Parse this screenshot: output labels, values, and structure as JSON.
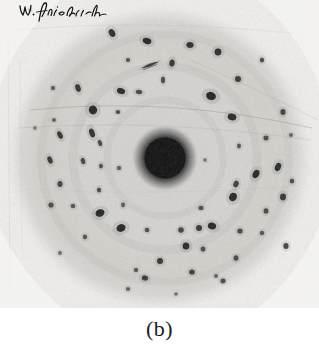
{
  "figure": {
    "caption": "(b)",
    "kind": "laue-x-ray-diffraction-photograph",
    "annotation_signature": "W. Friedrich",
    "pencil_mark_label": "pencil-stroke"
  },
  "colors": {
    "page_background": "#ffffff",
    "film_background": "#f0efed",
    "film_disc": "#d8d7d3",
    "film_disc_edge": "#c9c8c4",
    "spot_dark": "#151515",
    "spot_mid": "#3a3a3a",
    "center_beam": "#080808",
    "center_halo": "#8a8a88",
    "signature_ink": "#151515",
    "caption_text": "#1b1b1b",
    "grain": "#b9b8b4"
  },
  "plate": {
    "width": 319,
    "height": 308,
    "disc_center_x": 160,
    "disc_center_y": 158,
    "disc_radius": 146
  },
  "chart_data": {
    "type": "scatter",
    "title": "",
    "subtitle": "",
    "xlabel": "",
    "ylabel": "",
    "xlim": [
      0,
      319
    ],
    "ylim": [
      0,
      308
    ],
    "grid": false,
    "legend": "none",
    "center_beam": {
      "x": 165,
      "y": 158,
      "r": 21,
      "halo_r": 34
    },
    "spots": [
      {
        "x": 112,
        "y": 33,
        "rx": 3.0,
        "ry": 4.2,
        "a": -25,
        "d": 0.92
      },
      {
        "x": 147,
        "y": 41,
        "rx": 4.4,
        "ry": 3.0,
        "a": 15,
        "d": 0.96
      },
      {
        "x": 190,
        "y": 45,
        "rx": 3.6,
        "ry": 3.0,
        "a": 0,
        "d": 0.9
      },
      {
        "x": 128,
        "y": 60,
        "rx": 2.2,
        "ry": 2.0,
        "a": 0,
        "d": 0.7
      },
      {
        "x": 150,
        "y": 65,
        "rx": 6.5,
        "ry": 1.3,
        "a": -22,
        "d": 0.78
      },
      {
        "x": 172,
        "y": 63,
        "rx": 2.6,
        "ry": 3.6,
        "a": 10,
        "d": 0.88
      },
      {
        "x": 218,
        "y": 52,
        "rx": 3.4,
        "ry": 3.4,
        "a": 0,
        "d": 0.92
      },
      {
        "x": 262,
        "y": 60,
        "rx": 2.2,
        "ry": 2.6,
        "a": 0,
        "d": 0.72
      },
      {
        "x": 163,
        "y": 80,
        "rx": 2.0,
        "ry": 3.2,
        "a": 0,
        "d": 0.8
      },
      {
        "x": 238,
        "y": 79,
        "rx": 3.0,
        "ry": 3.0,
        "a": 0,
        "d": 0.85
      },
      {
        "x": 78,
        "y": 88,
        "rx": 2.6,
        "ry": 4.0,
        "a": -18,
        "d": 0.88
      },
      {
        "x": 53,
        "y": 88,
        "rx": 2.2,
        "ry": 2.2,
        "a": 0,
        "d": 0.62
      },
      {
        "x": 121,
        "y": 91,
        "rx": 4.2,
        "ry": 3.0,
        "a": 18,
        "d": 0.95
      },
      {
        "x": 139,
        "y": 92,
        "rx": 3.4,
        "ry": 2.2,
        "a": 10,
        "d": 0.72
      },
      {
        "x": 211,
        "y": 96,
        "rx": 5.0,
        "ry": 4.0,
        "a": 20,
        "d": 0.97
      },
      {
        "x": 93,
        "y": 110,
        "rx": 4.2,
        "ry": 4.4,
        "a": -15,
        "d": 0.95
      },
      {
        "x": 118,
        "y": 112,
        "rx": 2.4,
        "ry": 2.0,
        "a": 0,
        "d": 0.7
      },
      {
        "x": 283,
        "y": 112,
        "rx": 2.6,
        "ry": 3.0,
        "a": 0,
        "d": 0.8
      },
      {
        "x": 232,
        "y": 117,
        "rx": 4.4,
        "ry": 3.4,
        "a": 15,
        "d": 0.95
      },
      {
        "x": 54,
        "y": 120,
        "rx": 2.0,
        "ry": 2.0,
        "a": 0,
        "d": 0.6
      },
      {
        "x": 92,
        "y": 133,
        "rx": 2.6,
        "ry": 4.6,
        "a": -20,
        "d": 0.9
      },
      {
        "x": 60,
        "y": 135,
        "rx": 2.4,
        "ry": 4.0,
        "a": -25,
        "d": 0.88
      },
      {
        "x": 100,
        "y": 143,
        "rx": 2.0,
        "ry": 3.2,
        "a": -18,
        "d": 0.76
      },
      {
        "x": 266,
        "y": 138,
        "rx": 2.6,
        "ry": 2.4,
        "a": 0,
        "d": 0.72
      },
      {
        "x": 291,
        "y": 135,
        "rx": 2.0,
        "ry": 2.0,
        "a": 0,
        "d": 0.6
      },
      {
        "x": 239,
        "y": 146,
        "rx": 2.0,
        "ry": 2.4,
        "a": 0,
        "d": 0.68
      },
      {
        "x": 50,
        "y": 160,
        "rx": 2.4,
        "ry": 3.8,
        "a": -20,
        "d": 0.86
      },
      {
        "x": 83,
        "y": 161,
        "rx": 2.2,
        "ry": 3.2,
        "a": -15,
        "d": 0.78
      },
      {
        "x": 101,
        "y": 166,
        "rx": 2.0,
        "ry": 2.6,
        "a": 0,
        "d": 0.7
      },
      {
        "x": 119,
        "y": 168,
        "rx": 2.2,
        "ry": 2.2,
        "a": 0,
        "d": 0.62
      },
      {
        "x": 278,
        "y": 167,
        "rx": 3.0,
        "ry": 4.2,
        "a": 22,
        "d": 0.92
      },
      {
        "x": 256,
        "y": 174,
        "rx": 3.2,
        "ry": 4.4,
        "a": 25,
        "d": 0.94
      },
      {
        "x": 292,
        "y": 181,
        "rx": 2.2,
        "ry": 2.6,
        "a": 0,
        "d": 0.72
      },
      {
        "x": 236,
        "y": 184,
        "rx": 2.6,
        "ry": 3.4,
        "a": 18,
        "d": 0.82
      },
      {
        "x": 60,
        "y": 184,
        "rx": 2.6,
        "ry": 3.0,
        "a": 0,
        "d": 0.78
      },
      {
        "x": 99,
        "y": 190,
        "rx": 2.2,
        "ry": 2.6,
        "a": 0,
        "d": 0.7
      },
      {
        "x": 283,
        "y": 197,
        "rx": 3.0,
        "ry": 3.4,
        "a": 0,
        "d": 0.86
      },
      {
        "x": 51,
        "y": 205,
        "rx": 2.6,
        "ry": 2.6,
        "a": 0,
        "d": 0.74
      },
      {
        "x": 233,
        "y": 197,
        "rx": 3.8,
        "ry": 4.2,
        "a": 20,
        "d": 0.95
      },
      {
        "x": 73,
        "y": 206,
        "rx": 2.4,
        "ry": 2.2,
        "a": 0,
        "d": 0.66
      },
      {
        "x": 123,
        "y": 205,
        "rx": 2.0,
        "ry": 2.4,
        "a": 0,
        "d": 0.64
      },
      {
        "x": 100,
        "y": 213,
        "rx": 4.6,
        "ry": 3.6,
        "a": -20,
        "d": 0.96
      },
      {
        "x": 201,
        "y": 208,
        "rx": 2.6,
        "ry": 2.2,
        "a": 0,
        "d": 0.7
      },
      {
        "x": 266,
        "y": 211,
        "rx": 2.4,
        "ry": 2.8,
        "a": 0,
        "d": 0.76
      },
      {
        "x": 121,
        "y": 228,
        "rx": 4.6,
        "ry": 3.8,
        "a": -18,
        "d": 0.96
      },
      {
        "x": 147,
        "y": 230,
        "rx": 2.4,
        "ry": 2.2,
        "a": 0,
        "d": 0.74
      },
      {
        "x": 181,
        "y": 230,
        "rx": 2.8,
        "ry": 2.8,
        "a": 0,
        "d": 0.8
      },
      {
        "x": 199,
        "y": 228,
        "rx": 3.0,
        "ry": 3.0,
        "a": 0,
        "d": 0.86
      },
      {
        "x": 212,
        "y": 226,
        "rx": 4.2,
        "ry": 3.4,
        "a": 18,
        "d": 0.95
      },
      {
        "x": 240,
        "y": 231,
        "rx": 2.6,
        "ry": 2.6,
        "a": 0,
        "d": 0.78
      },
      {
        "x": 262,
        "y": 233,
        "rx": 2.2,
        "ry": 2.2,
        "a": 0,
        "d": 0.66
      },
      {
        "x": 85,
        "y": 237,
        "rx": 2.2,
        "ry": 2.4,
        "a": 0,
        "d": 0.66
      },
      {
        "x": 186,
        "y": 246,
        "rx": 3.4,
        "ry": 3.6,
        "a": 0,
        "d": 0.93
      },
      {
        "x": 203,
        "y": 249,
        "rx": 2.4,
        "ry": 2.6,
        "a": 0,
        "d": 0.74
      },
      {
        "x": 160,
        "y": 261,
        "rx": 3.0,
        "ry": 3.0,
        "a": 0,
        "d": 0.88
      },
      {
        "x": 236,
        "y": 258,
        "rx": 2.4,
        "ry": 2.8,
        "a": 0,
        "d": 0.76
      },
      {
        "x": 286,
        "y": 246,
        "rx": 2.6,
        "ry": 3.0,
        "a": 0,
        "d": 0.8
      },
      {
        "x": 136,
        "y": 270,
        "rx": 2.2,
        "ry": 2.2,
        "a": 0,
        "d": 0.64
      },
      {
        "x": 192,
        "y": 272,
        "rx": 2.8,
        "ry": 2.6,
        "a": 0,
        "d": 0.82
      },
      {
        "x": 216,
        "y": 276,
        "rx": 2.0,
        "ry": 2.0,
        "a": 0,
        "d": 0.6
      },
      {
        "x": 145,
        "y": 278,
        "rx": 3.2,
        "ry": 2.6,
        "a": 10,
        "d": 0.85
      },
      {
        "x": 223,
        "y": 281,
        "rx": 2.6,
        "ry": 2.4,
        "a": 0,
        "d": 0.72
      },
      {
        "x": 128,
        "y": 289,
        "rx": 2.2,
        "ry": 2.0,
        "a": 0,
        "d": 0.6
      },
      {
        "x": 176,
        "y": 294,
        "rx": 1.8,
        "ry": 1.8,
        "a": 0,
        "d": 0.55
      },
      {
        "x": 60,
        "y": 253,
        "rx": 2.0,
        "ry": 2.0,
        "a": 0,
        "d": 0.56
      },
      {
        "x": 35,
        "y": 128,
        "rx": 1.8,
        "ry": 1.8,
        "a": 0,
        "d": 0.5
      },
      {
        "x": 205,
        "y": 160,
        "rx": 1.8,
        "ry": 1.8,
        "a": 0,
        "d": 0.5
      },
      {
        "x": 30,
        "y": 10,
        "rx": 2.0,
        "ry": 2.0,
        "a": 0,
        "d": 0.5
      }
    ]
  }
}
